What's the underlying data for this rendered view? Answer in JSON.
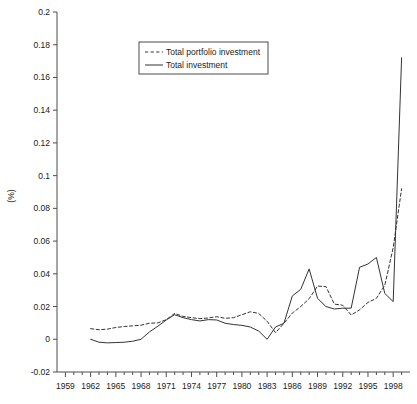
{
  "chart_data": {
    "type": "line",
    "title": "",
    "xlabel": "",
    "ylabel": "(%)",
    "xlim": [
      1958,
      2000
    ],
    "ylim": [
      -0.02,
      0.2
    ],
    "grid": false,
    "legend_position": "top-center",
    "y_ticks": [
      "-0.02",
      "0",
      "0.02",
      "0.04",
      "0.06",
      "0.08",
      "0.1",
      "0.12",
      "0.14",
      "0.16",
      "0.18",
      "0.2"
    ],
    "y_tick_values": [
      -0.02,
      0,
      0.02,
      0.04,
      0.06,
      0.08,
      0.1,
      0.12,
      0.14,
      0.16,
      0.18,
      0.2
    ],
    "x_ticks": [
      "1959",
      "1962",
      "1965",
      "1968",
      "1971",
      "1974",
      "1977",
      "1980",
      "1983",
      "1986",
      "1989",
      "1992",
      "1995",
      "1998"
    ],
    "x_tick_values": [
      1959,
      1962,
      1965,
      1968,
      1971,
      1974,
      1977,
      1980,
      1983,
      1986,
      1989,
      1992,
      1995,
      1998
    ],
    "x_minor_step": 1,
    "x": [
      1962,
      1963,
      1964,
      1965,
      1966,
      1967,
      1968,
      1969,
      1970,
      1971,
      1972,
      1973,
      1974,
      1975,
      1976,
      1977,
      1978,
      1979,
      1980,
      1981,
      1982,
      1983,
      1984,
      1985,
      1986,
      1987,
      1988,
      1989,
      1990,
      1991,
      1992,
      1993,
      1994,
      1995,
      1996,
      1997,
      1998,
      1999
    ],
    "series": [
      {
        "name": "Total portfolio investment",
        "style": "dashed",
        "color": "#333333",
        "values": [
          0.0065,
          0.0058,
          0.0062,
          0.0072,
          0.0078,
          0.0082,
          0.0086,
          0.0098,
          0.01,
          0.012,
          0.0158,
          0.014,
          0.0132,
          0.0126,
          0.013,
          0.0138,
          0.0128,
          0.0132,
          0.015,
          0.0168,
          0.0158,
          0.011,
          0.004,
          0.0098,
          0.016,
          0.02,
          0.0248,
          0.0325,
          0.0322,
          0.0215,
          0.0208,
          0.0148,
          0.018,
          0.0225,
          0.025,
          0.033,
          0.056,
          0.092
        ]
      },
      {
        "name": "Total investment",
        "style": "solid",
        "color": "#333333",
        "values": [
          0.0,
          -0.0018,
          -0.0022,
          -0.002,
          -0.0018,
          -0.0012,
          0.0,
          0.0045,
          0.008,
          0.0118,
          0.015,
          0.0132,
          0.012,
          0.0112,
          0.012,
          0.0118,
          0.0098,
          0.009,
          0.0085,
          0.0075,
          0.005,
          0.0,
          0.0075,
          0.0098,
          0.0265,
          0.0305,
          0.043,
          0.025,
          0.02,
          0.0185,
          0.019,
          0.019,
          0.044,
          0.046,
          0.05,
          0.028,
          0.023,
          0.172
        ]
      }
    ]
  },
  "legend": {
    "items": [
      {
        "label": "Total portfolio investment",
        "style": "dashed"
      },
      {
        "label": "Total investment",
        "style": "solid"
      }
    ]
  }
}
